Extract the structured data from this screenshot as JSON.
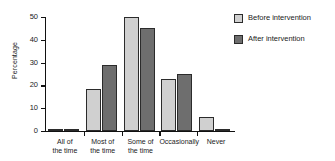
{
  "chart_data": {
    "type": "bar",
    "title": "",
    "xlabel": "",
    "ylabel": "Percentage",
    "ylim": [
      0,
      50
    ],
    "yticks": [
      0,
      10,
      20,
      30,
      40,
      50
    ],
    "ytick_labels": [
      "0",
      "10",
      "20",
      "30",
      "40",
      "50"
    ],
    "grid": false,
    "legend_position": "right",
    "categories": [
      "All of\nthe time",
      "Most of\nthe time",
      "Some of\nthe time",
      "Occasionally",
      "Never"
    ],
    "series": [
      {
        "name": "Before intervention",
        "color": "#d0d0d0",
        "values": [
          0.5,
          18.5,
          50,
          23,
          6
        ]
      },
      {
        "name": "After intervention",
        "color": "#6e6e6e",
        "values": [
          0.5,
          29,
          45,
          25,
          0.5
        ]
      }
    ]
  },
  "colors": {
    "before": "#d0d0d0",
    "after": "#6e6e6e",
    "axis": "#111111",
    "text": "#1a1a1a",
    "background": "#ffffff"
  }
}
